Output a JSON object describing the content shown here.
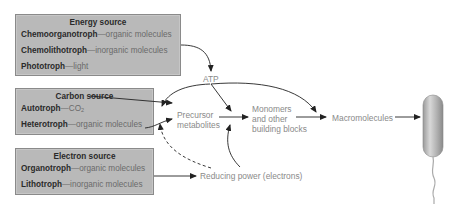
{
  "energy_source": {
    "title": "Energy source",
    "items": [
      {
        "term": "Chemoorganotroph",
        "sep": "—",
        "desc": "organic molecules"
      },
      {
        "term": "Chemolithotroph",
        "sep": "—",
        "desc": "inorganic molecules"
      },
      {
        "term": "Phototroph",
        "sep": "—",
        "desc": "light"
      }
    ]
  },
  "carbon_source": {
    "title": "Carbon source",
    "items": [
      {
        "term": "Autotroph",
        "sep": "—",
        "desc": "CO",
        "desc_sub": "2"
      },
      {
        "term": "Heterotroph",
        "sep": "—",
        "desc": "organic molecules"
      }
    ]
  },
  "electron_source": {
    "title": "Electron source",
    "items": [
      {
        "term": "Organotroph",
        "sep": "—",
        "desc": "organic molecules"
      },
      {
        "term": "Lithotroph",
        "sep": "—",
        "desc": "inorganic molecules"
      }
    ]
  },
  "nodes": {
    "atp": "ATP",
    "precursor_line1": "Precursor",
    "precursor_line2": "metabolites",
    "monomers_line1": "Monomers",
    "monomers_line2": "and other",
    "monomers_line3": "building blocks",
    "macromolecules": "Macromolecules",
    "reducing_power": "Reducing power (electrons)"
  },
  "icons": {
    "cell": "rod-bacterium-with-flagellum"
  },
  "colors": {
    "box_fill": "#b9b9b9",
    "box_border": "#8a8a8a",
    "label_gray": "#8a8a8a",
    "arrow": "#222222"
  }
}
